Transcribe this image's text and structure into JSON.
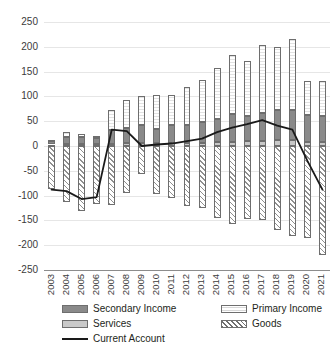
{
  "chart_data": {
    "type": "bar",
    "title": "",
    "subtitle": "",
    "xlabel": "",
    "ylabel": "",
    "ylim": [
      -250,
      250
    ],
    "ytick_step": 50,
    "yticks": [
      250,
      200,
      150,
      100,
      50,
      0,
      -50,
      -100,
      -150,
      -200,
      -250
    ],
    "ytick_labels": [
      "250",
      "200",
      "150",
      "100",
      "50",
      "0",
      "-50",
      "-100",
      "-150",
      "-200",
      "-250"
    ],
    "grid": true,
    "stacked": true,
    "legend_position": "bottom",
    "categories": [
      "2003",
      "2004",
      "2005",
      "2006",
      "2007",
      "2008",
      "2009",
      "2010",
      "2011",
      "2012",
      "2013",
      "2014",
      "2015",
      "2016",
      "2017",
      "2018",
      "2019",
      "2020",
      "2021"
    ],
    "series": [
      {
        "name": "Goods",
        "kind": "bar",
        "swatch": "goods-hatch",
        "values": [
          -87,
          -113,
          -131,
          -117,
          -118,
          -95,
          -57,
          -96,
          -105,
          -120,
          -126,
          -145,
          -158,
          -148,
          -150,
          -170,
          -182,
          -185,
          -220
        ]
      },
      {
        "name": "Services",
        "kind": "bar",
        "swatch": "services-lightgray",
        "values": [
          3,
          5,
          5,
          4,
          5,
          6,
          6,
          6,
          7,
          7,
          7,
          8,
          9,
          10,
          10,
          12,
          12,
          8,
          8
        ]
      },
      {
        "name": "Secondary Income",
        "kind": "bar",
        "swatch": "secondary-darkgray",
        "values": [
          8,
          13,
          14,
          13,
          27,
          31,
          36,
          28,
          35,
          36,
          42,
          46,
          56,
          50,
          56,
          60,
          61,
          55,
          53
        ]
      },
      {
        "name": "Primary Income",
        "kind": "bar",
        "swatch": "primary-lined",
        "values": [
          2,
          11,
          6,
          4,
          40,
          56,
          59,
          69,
          60,
          76,
          85,
          104,
          118,
          112,
          137,
          128,
          142,
          68,
          70
        ]
      },
      {
        "name": "Current Account",
        "kind": "line",
        "swatch": "line-black",
        "values": [
          -88,
          -91,
          -107,
          -103,
          33,
          30,
          0,
          3,
          5,
          10,
          15,
          28,
          37,
          44,
          52,
          41,
          33,
          -30,
          -88
        ]
      }
    ],
    "legend": [
      {
        "label": "Secondary Income",
        "swatch": "secondary-darkgray"
      },
      {
        "label": "Primary Income",
        "swatch": "primary-lined"
      },
      {
        "label": "Services",
        "swatch": "services-lightgray"
      },
      {
        "label": "Goods",
        "swatch": "goods-hatch"
      },
      {
        "label": "Current Account",
        "swatch": "line-black"
      }
    ],
    "colors": {
      "secondary_income": "#8a8a8a",
      "primary_income": "#f2f2f2",
      "services": "#c9c9c9",
      "goods": "#ffffff",
      "current_account_line": "#1a1a1a",
      "gridline": "#e6e6e6",
      "axis": "#8c8c8c",
      "text": "#231f20",
      "background": "#ffffff"
    }
  }
}
